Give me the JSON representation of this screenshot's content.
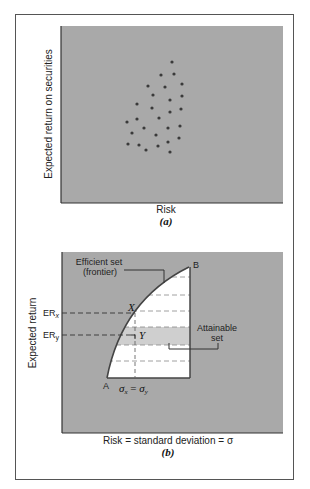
{
  "colors": {
    "plot_fill": "#a9a9a9",
    "attainable_fill": "#ffffff",
    "band_fill": "#cfcfcf",
    "ink": "#333333",
    "dot": "#3a3a3a"
  },
  "chart_data": [
    {
      "type": "scatter",
      "panel": "(a)",
      "title": "",
      "xlabel": "Risk",
      "ylabel": "Expected return on securities",
      "grid": false,
      "legend": null,
      "ticks": "none",
      "points_pixel": [
        [
          172,
          62
        ],
        [
          161,
          75
        ],
        [
          174,
          74
        ],
        [
          148,
          86
        ],
        [
          165,
          87
        ],
        [
          182,
          84
        ],
        [
          153,
          95
        ],
        [
          170,
          100
        ],
        [
          182,
          96
        ],
        [
          137,
          104
        ],
        [
          152,
          108
        ],
        [
          170,
          112
        ],
        [
          181,
          109
        ],
        [
          137,
          119
        ],
        [
          159,
          118
        ],
        [
          127,
          122
        ],
        [
          144,
          128
        ],
        [
          168,
          128
        ],
        [
          180,
          126
        ],
        [
          132,
          133
        ],
        [
          156,
          135
        ],
        [
          179,
          138
        ],
        [
          168,
          142
        ],
        [
          128,
          144
        ],
        [
          139,
          145
        ],
        [
          158,
          146
        ],
        [
          146,
          150
        ],
        [
          170,
          152
        ]
      ]
    },
    {
      "type": "area",
      "panel": "(b)",
      "title": "",
      "xlabel": "Risk = standard deviation = σ",
      "ylabel": "Expected return",
      "grid": false,
      "annotations": [
        "Efficient set (frontier)",
        "Attainable set",
        "A",
        "B",
        "X",
        "Y",
        "ER_x",
        "ER_y",
        "σx = σy"
      ],
      "frontier_from": "A",
      "frontier_to": "B",
      "y_ticks": [
        "ERx",
        "ERy"
      ]
    }
  ],
  "panel_a": {
    "ylabel": "Expected return on securities",
    "xlabel": "Risk",
    "caption": "(a)"
  },
  "panel_b": {
    "ylabel": "Expected return",
    "xlabel": "Risk = standard deviation = σ",
    "caption": "(b)",
    "efficient_label_1": "Efficient set",
    "efficient_label_2": "(frontier)",
    "attainable_label_1": "Attainable",
    "attainable_label_2": "set",
    "point_a": "A",
    "point_b": "B",
    "point_x": "X",
    "point_y": "Y",
    "er_x": "ER",
    "er_x_sub": "x",
    "er_y": "ER",
    "er_y_sub": "y",
    "sigma_eq_1": "σ",
    "sigma_eq_sub1": "x",
    "sigma_eq_mid": " = ",
    "sigma_eq_2": "σ",
    "sigma_eq_sub2": "y"
  }
}
